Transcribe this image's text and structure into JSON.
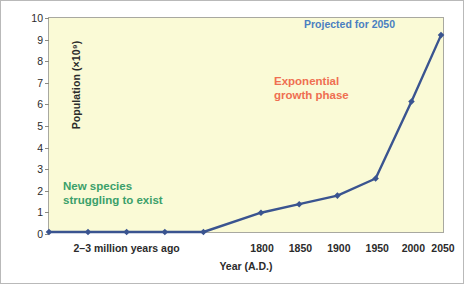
{
  "chart_data": {
    "type": "line",
    "title": "",
    "xlabel": "Year (A.D.)",
    "ylabel": "Population (×10⁹)",
    "ylim": [
      0,
      10
    ],
    "y_ticks": [
      0,
      1,
      2,
      3,
      4,
      5,
      6,
      7,
      8,
      9,
      10
    ],
    "y_tick_labels": [
      "0",
      "1",
      "2",
      "3",
      "4",
      "5",
      "6",
      "7",
      "8",
      "9",
      "10"
    ],
    "grid": false,
    "legend": "none",
    "x_tick_labels": [
      "1800",
      "1850",
      "1900",
      "1950",
      "2000",
      "2050"
    ],
    "x_span_label": "2–3 million years ago",
    "series": [
      {
        "name": "World population",
        "color": "#3a5490",
        "marker": "diamond",
        "points": [
          {
            "x_label": "2-3 million years ago",
            "x_pos": 0.0,
            "value": 0.0
          },
          {
            "x_label": "",
            "x_pos": 9.9,
            "value": 0.0
          },
          {
            "x_label": "",
            "x_pos": 19.7,
            "value": 0.0
          },
          {
            "x_label": "",
            "x_pos": 29.4,
            "value": 0.0
          },
          {
            "x_label": "",
            "x_pos": 39.2,
            "value": 0.0
          },
          {
            "x_label": "1800",
            "x_pos": 53.8,
            "value": 0.9
          },
          {
            "x_label": "1850",
            "x_pos": 63.5,
            "value": 1.3
          },
          {
            "x_label": "1900",
            "x_pos": 73.2,
            "value": 1.7
          },
          {
            "x_label": "1950",
            "x_pos": 82.9,
            "value": 2.5
          },
          {
            "x_label": "2000",
            "x_pos": 92.0,
            "value": 6.1
          },
          {
            "x_label": "2050",
            "x_pos": 99.5,
            "value": 9.2
          }
        ]
      }
    ],
    "annotations": [
      {
        "name": "new-species",
        "lines": [
          "New species",
          "struggling to exist"
        ],
        "color": "#3aa06a"
      },
      {
        "name": "exponential-growth",
        "lines": [
          "Exponential",
          "growth phase"
        ],
        "color": "#ef6f51"
      },
      {
        "name": "projected-2050",
        "lines": [
          "Projected for 2050"
        ],
        "color": "#4a7fc1"
      }
    ],
    "colors": {
      "plot_background": "#fafad6",
      "line": "#3a5490",
      "marker": "#3a5490",
      "axis": "#8a8a82",
      "frame": "#b9b9b9",
      "text": "#2b2b2b"
    }
  },
  "annotation_text": {
    "new_species_line1": "New species",
    "new_species_line2": "struggling to exist",
    "exponential_line1": "Exponential",
    "exponential_line2": "growth phase",
    "projected": "Projected for 2050"
  },
  "axes": {
    "x_title": "Year (A.D.)",
    "y_title": "Population (×10⁹)",
    "x_span_label": "2–3 million years ago"
  }
}
